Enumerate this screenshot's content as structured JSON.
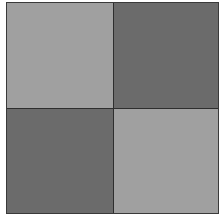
{
  "pattern": {
    "type": "checkerboard",
    "rows": 2,
    "cols": 2,
    "cells": [
      {
        "position": "top-left",
        "tone": "light",
        "color": "#a0a0a0"
      },
      {
        "position": "top-right",
        "tone": "dark",
        "color": "#6b6b6b"
      },
      {
        "position": "bottom-left",
        "tone": "dark",
        "color": "#6b6b6b"
      },
      {
        "position": "bottom-right",
        "tone": "light",
        "color": "#a0a0a0"
      }
    ],
    "border_color": "#2e2e2e"
  }
}
